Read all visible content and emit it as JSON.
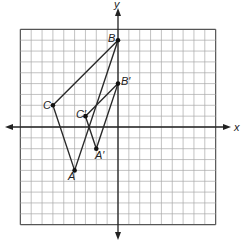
{
  "diagram": {
    "type": "coordinate-plane",
    "axes": {
      "x_label": "x",
      "y_label": "y",
      "x_range": [
        -9,
        9
      ],
      "y_range": [
        -9,
        9
      ],
      "grid": true
    },
    "colors": {
      "grid": "#a9a9a9",
      "axis": "#222222",
      "shape": "#2a2a2a",
      "point": "#111111"
    },
    "triangles": [
      {
        "name": "ABC",
        "vertices": [
          {
            "label": "A",
            "x": -4,
            "y": -4
          },
          {
            "label": "B",
            "x": 0,
            "y": 8
          },
          {
            "label": "C",
            "x": -6,
            "y": 2
          }
        ]
      },
      {
        "name": "A'B'C'",
        "vertices": [
          {
            "label": "A′",
            "x": -2,
            "y": -2
          },
          {
            "label": "B′",
            "x": 0,
            "y": 4
          },
          {
            "label": "C′",
            "x": -3,
            "y": 1
          }
        ]
      }
    ]
  }
}
